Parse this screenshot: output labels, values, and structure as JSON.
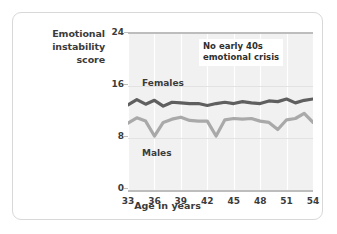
{
  "figure": {
    "y_axis_title": "Emotional instability score",
    "x_axis_title": "Age in years",
    "annotation": "No early 40s emotional crisis",
    "annotation_line1": "No early 40s",
    "annotation_line2": "emotional crisis",
    "females_label": "Females",
    "males_label": "Males",
    "colors": {
      "females_line": "#5f5f5f",
      "males_line": "#a9a9a9",
      "plot_background": "#f1f1f1",
      "gridline": "#ffffff",
      "axis": "#bdbdbd",
      "border": "#d8d8d8",
      "text": "#3b3b3b"
    }
  },
  "chart_data": {
    "type": "line",
    "title": "",
    "xlabel": "Age in years",
    "ylabel": "Emotional instability score",
    "xlim": [
      33,
      54
    ],
    "ylim": [
      0,
      24
    ],
    "xticks": [
      33,
      36,
      39,
      42,
      45,
      48,
      51,
      54
    ],
    "yticks": [
      0,
      8,
      16,
      24
    ],
    "grid": "vertical",
    "legend": "inline-labels",
    "annotations": [
      {
        "text": "No early 40s emotional crisis",
        "x": 46.5,
        "y": 21.0
      }
    ],
    "x": [
      33,
      34,
      35,
      36,
      37,
      38,
      39,
      40,
      41,
      42,
      43,
      44,
      45,
      46,
      47,
      48,
      49,
      50,
      51,
      52,
      53,
      54
    ],
    "series": [
      {
        "name": "Females",
        "color": "#5f5f5f",
        "values": [
          13.1,
          13.9,
          13.2,
          13.8,
          12.9,
          13.5,
          13.4,
          13.3,
          13.3,
          13.0,
          13.3,
          13.5,
          13.3,
          13.6,
          13.4,
          13.3,
          13.7,
          13.6,
          14.0,
          13.4,
          13.8,
          14.0
        ]
      },
      {
        "name": "Males",
        "color": "#a9a9a9",
        "values": [
          10.3,
          11.1,
          10.6,
          8.3,
          10.4,
          10.9,
          11.2,
          10.7,
          10.6,
          10.6,
          8.3,
          10.8,
          11.0,
          10.9,
          11.0,
          10.6,
          10.4,
          9.3,
          10.8,
          11.0,
          11.8,
          10.4
        ]
      }
    ]
  }
}
